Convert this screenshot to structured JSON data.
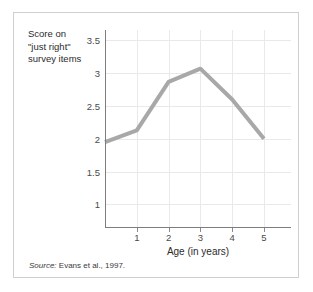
{
  "figure": {
    "y_axis_title": "Score on\n\"just right\"\nsurvey items",
    "x_axis_title": "Age (in years)",
    "source_prefix": "Source:",
    "source_text": " Evans et al., 1997.",
    "frame_color": "#cfcfcf",
    "grid_color": "#e9e9e9",
    "axis_color": "#7d7d7d",
    "line_color": "#a8a8a8",
    "background": "#ffffff"
  },
  "chart_data": {
    "type": "line",
    "title": "",
    "xlabel": "Age (in years)",
    "ylabel": "Score on \"just right\" survey items",
    "x": [
      0,
      1,
      2,
      3,
      4,
      5
    ],
    "values": [
      1.95,
      2.13,
      2.87,
      3.07,
      2.6,
      2.0
    ],
    "series": [
      {
        "name": "Score on \"just right\" survey items",
        "values": [
          1.95,
          2.13,
          2.87,
          3.07,
          2.6,
          2.0
        ]
      }
    ],
    "xlim": [
      0,
      5.85
    ],
    "ylim": [
      0.64,
      3.66
    ],
    "xticks": [
      1,
      2,
      3,
      4,
      5
    ],
    "xtick_labels": [
      "1",
      "2",
      "3",
      "4",
      "5"
    ],
    "yticks": [
      1,
      1.5,
      2,
      2.5,
      3,
      3.5
    ],
    "ytick_labels": [
      "1",
      "1.5",
      "2",
      "2.5",
      "3",
      "3.5"
    ],
    "grid": true,
    "legend": "none",
    "line_color": "#a8a8a8",
    "line_width": 4,
    "markers": "none",
    "source": "Source: Evans et al., 1997."
  }
}
